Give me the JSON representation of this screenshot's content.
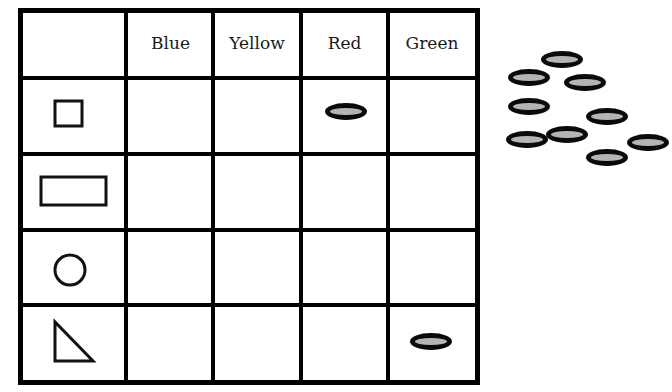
{
  "table": {
    "column_headers": [
      "Blue",
      "Yellow",
      "Red",
      "Green"
    ],
    "row_shapes": [
      "small-square",
      "rectangle",
      "circle",
      "right-triangle"
    ],
    "placed_tokens": [
      {
        "row": 0,
        "column": "Red"
      },
      {
        "row": 3,
        "column": "Green"
      }
    ]
  },
  "loose_tokens": {
    "count": 9
  },
  "colors": {
    "line": "#000000",
    "token_fill": "#b4b4b4",
    "token_border": "#0a0a0a",
    "background": "#ffffff"
  }
}
